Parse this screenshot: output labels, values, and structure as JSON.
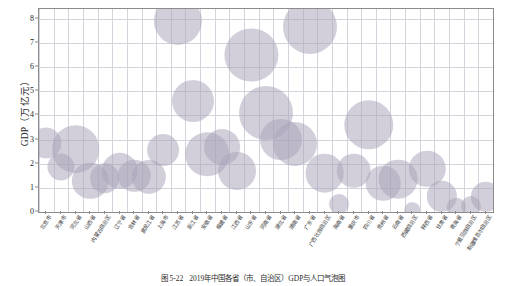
{
  "figure": {
    "caption_number": "图 5-22",
    "caption_text": "2019年中国各省（市、自治区）GDP与人口气泡图"
  },
  "axes": {
    "y_title": "GDP（万亿元）",
    "y_ticks": [
      "0",
      "1",
      "2",
      "3",
      "4",
      "5",
      "6",
      "7",
      "8"
    ],
    "x_title": ""
  },
  "chart_data": {
    "type": "scatter",
    "title": "",
    "subtitle": "",
    "xlabel": "",
    "ylabel": "GDP（万亿元）",
    "ylim": [
      0,
      8.4
    ],
    "grid": true,
    "legend": "none",
    "bubble_encoding": "面积表示人口规模",
    "marker_color": "#a9a3b8",
    "marker_opacity": 0.52,
    "categories": [
      "北京市",
      "天津市",
      "河北省",
      "山西省",
      "内蒙古自治区",
      "辽宁省",
      "吉林省",
      "黑龙江省",
      "上海市",
      "江苏省",
      "浙江省",
      "安徽省",
      "福建省",
      "江西省",
      "山东省",
      "河南省",
      "湖北省",
      "湖南省",
      "广东省",
      "广西壮族自治区",
      "海南省",
      "重庆市",
      "四川省",
      "贵州省",
      "云南省",
      "西藏自治区",
      "陕西省",
      "甘肃省",
      "青海省",
      "宁夏回族自治区",
      "新疆维吾尔自治区"
    ],
    "series": [
      {
        "name": "GDP（万亿元）",
        "values": [
          2.85,
          1.88,
          2.6,
          1.3,
          1.4,
          1.7,
          1.5,
          1.45,
          2.55,
          7.9,
          4.6,
          2.4,
          2.7,
          1.7,
          6.5,
          4.1,
          3.0,
          2.8,
          7.65,
          1.6,
          0.35,
          1.7,
          3.6,
          1.2,
          1.35,
          0.08,
          1.8,
          0.65,
          0.2,
          0.25,
          0.62
        ],
        "unit": "万亿元"
      },
      {
        "name": "人口（气泡面积）",
        "values": [
          36,
          26,
          96,
          52,
          32,
          52,
          40,
          45,
          38,
          98,
          72,
          78,
          50,
          57,
          122,
          126,
          72,
          80,
          126,
          60,
          12,
          46,
          104,
          46,
          60,
          6,
          52,
          34,
          10,
          12,
          34
        ],
        "unit": "百万人"
      }
    ]
  }
}
